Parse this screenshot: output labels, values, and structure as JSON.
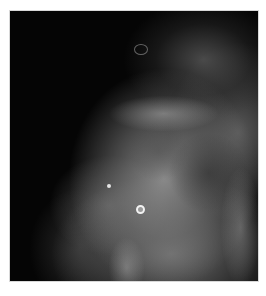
{
  "image": {
    "description": "Grayscale mammographic view showing dense fibroglandular breast tissue against dark background",
    "colors": {
      "background": "#ffffff",
      "film": "#050505",
      "tissue": "#a0a0a0",
      "highlight": "#f2f2f2"
    },
    "features": [
      {
        "name": "ring-calcification",
        "x": 140,
        "y": 209
      },
      {
        "name": "punctate-calcification",
        "x": 109,
        "y": 186
      },
      {
        "name": "upper-ring-structure",
        "x": 141,
        "y": 49
      }
    ]
  }
}
